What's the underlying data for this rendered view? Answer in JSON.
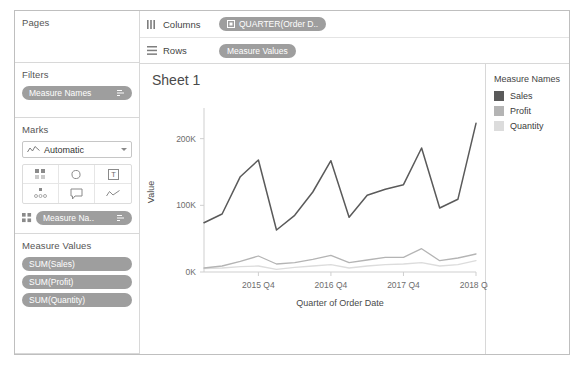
{
  "sidebar": {
    "pages": {
      "title": "Pages"
    },
    "filters": {
      "title": "Filters",
      "pill": {
        "label": "Measure Names",
        "end_icon": "sort-icon"
      }
    },
    "marks": {
      "title": "Marks",
      "mark_type": "Automatic",
      "mark_type_icon": "line-chart-icon",
      "buttons": [
        {
          "name": "color-button",
          "icon": "color-dots-icon"
        },
        {
          "name": "size-button",
          "icon": "size-circle-icon"
        },
        {
          "name": "label-button",
          "icon": "text-label-icon"
        },
        {
          "name": "detail-button",
          "icon": "detail-dots-icon"
        },
        {
          "name": "tooltip-button",
          "icon": "tooltip-bubble-icon"
        },
        {
          "name": "path-button",
          "icon": "path-line-icon"
        }
      ],
      "encoding_pill": {
        "icon": "color-dots-icon",
        "label": "Measure Na..",
        "end_icon": "sort-icon"
      }
    },
    "measure_values": {
      "title": "Measure Values",
      "pills": [
        "SUM(Sales)",
        "SUM(Profit)",
        "SUM(Quantity)"
      ]
    }
  },
  "shelves": [
    {
      "name": "columns-shelf",
      "icon": "columns-icon",
      "label": "Columns",
      "pill": "QUARTER(Order D..",
      "pill_icon": "calendar-icon"
    },
    {
      "name": "rows-shelf",
      "icon": "rows-icon",
      "label": "Rows",
      "pill": "Measure Values",
      "pill_icon": ""
    }
  ],
  "worksheet": {
    "title": "Sheet 1"
  },
  "legend": {
    "title": "Measure Names",
    "items": [
      {
        "label": "Sales",
        "color": "#5a5a5a"
      },
      {
        "label": "Profit",
        "color": "#b4b4b4"
      },
      {
        "label": "Quantity",
        "color": "#dcdcdc"
      }
    ]
  },
  "chart_data": {
    "type": "line",
    "title": "Sheet 1",
    "xlabel": "Quarter of Order Date",
    "ylabel": "Value",
    "ylim": [
      0,
      240000
    ],
    "yticks": [
      0,
      100000,
      200000
    ],
    "ytick_labels": [
      "0K",
      "100K",
      "200K"
    ],
    "grid": false,
    "legend_position": "right",
    "x": [
      "2015 Q1",
      "2015 Q2",
      "2015 Q3",
      "2015 Q4",
      "2016 Q1",
      "2016 Q2",
      "2016 Q3",
      "2016 Q4",
      "2017 Q1",
      "2017 Q2",
      "2017 Q3",
      "2017 Q4",
      "2018 Q1",
      "2018 Q2",
      "2018 Q3",
      "2018 Q4"
    ],
    "xtick_labels": [
      "2015 Q4",
      "2016 Q4",
      "2017 Q4",
      "2018 Q4"
    ],
    "xtick_indices": [
      3,
      7,
      11,
      15
    ],
    "series": [
      {
        "name": "Sales",
        "color": "#5a5a5a",
        "values": [
          74000,
          87000,
          143000,
          168000,
          63000,
          85000,
          120000,
          167000,
          82000,
          115000,
          124000,
          131000,
          186000,
          96000,
          109000,
          223000
        ]
      },
      {
        "name": "Profit",
        "color": "#dcdcdc",
        "values": [
          5000,
          6000,
          8000,
          9000,
          4000,
          7000,
          9000,
          11000,
          6000,
          9000,
          11000,
          12000,
          14000,
          9000,
          11000,
          17000
        ]
      },
      {
        "name": "Quantity",
        "color": "#b4b4b4",
        "values": [
          6000,
          9000,
          16000,
          24000,
          12000,
          14000,
          19000,
          25000,
          14000,
          18000,
          22000,
          22000,
          35000,
          17000,
          21000,
          27000
        ]
      }
    ]
  }
}
